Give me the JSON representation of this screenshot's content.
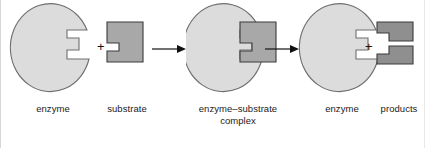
{
  "figure": {
    "background_color": "#ffffff",
    "enzyme_fill": "#dcdcdc",
    "enzyme_stroke": "#6e6e6e",
    "substrate_fill": "#a8a8a8",
    "substrate_stroke": "#3a3a3a",
    "arrow_color": "#111111",
    "text_color": "#1a1a1a"
  },
  "stages": [
    {
      "id": "enzyme-1",
      "label": "enzyme",
      "label_line2": "",
      "shape": "enzyme-ellipse-notched"
    },
    {
      "id": "substrate",
      "label": "substrate",
      "label_line2": "",
      "shape": "substrate-block-notched"
    },
    {
      "id": "enzyme-substrate-complex",
      "label": "enzyme–substrate",
      "label_line2": "complex",
      "shape": "enzyme-with-substrate-bound"
    },
    {
      "id": "enzyme-2",
      "label": "enzyme",
      "label_line2": "",
      "shape": "enzyme-ellipse-notched"
    },
    {
      "id": "products",
      "label": "products",
      "label_line2": "",
      "shape": "two-product-blocks"
    }
  ],
  "operators": [
    {
      "id": "plus-1",
      "symbol": "+",
      "between": "enzyme-1 and substrate"
    },
    {
      "id": "plus-2",
      "symbol": "+",
      "between": "enzyme-2 and products"
    }
  ],
  "arrows": [
    {
      "id": "arrow-1",
      "direction": "right",
      "between": "substrate and complex"
    },
    {
      "id": "arrow-2",
      "direction": "right",
      "between": "complex and enzyme-2"
    }
  ]
}
